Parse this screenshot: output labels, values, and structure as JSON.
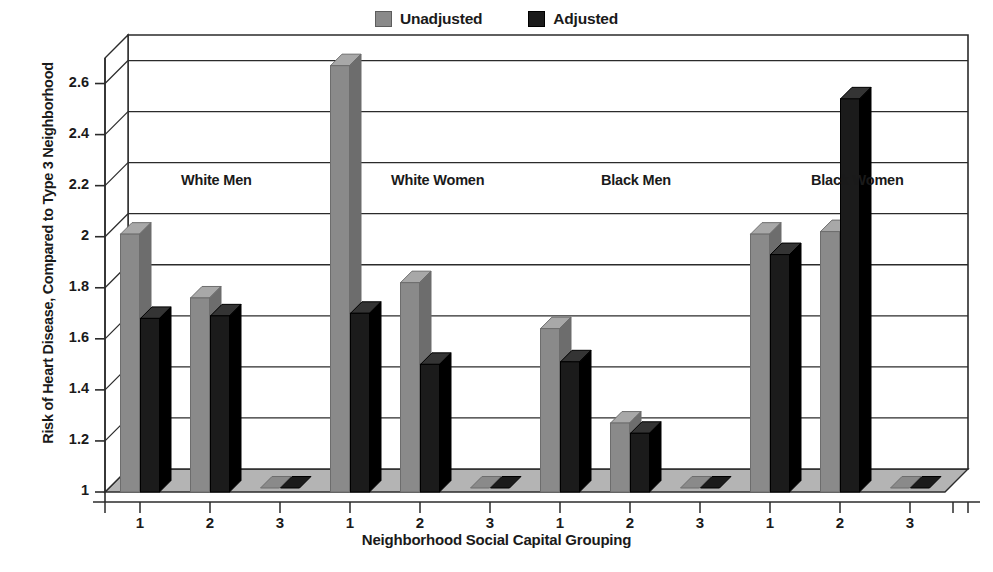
{
  "legend": {
    "items": [
      {
        "label": "Unadjusted",
        "color": "#8a8a8a",
        "swatch": "unadjusted-swatch"
      },
      {
        "label": "Adjusted",
        "color": "#1b1b1b",
        "swatch": "adjusted-swatch"
      }
    ]
  },
  "axes": {
    "ylabel": "Risk of Heart Disease, Compared to Type 3 Neighborhood",
    "xlabel": "Neighborhood Social Capital Grouping",
    "yticks": [
      "1",
      "1.2",
      "1.4",
      "1.6",
      "1.8",
      "2",
      "2.2",
      "2.4",
      "2.6"
    ],
    "ymin": 1,
    "ymax": 2.7
  },
  "chart_data": {
    "type": "bar",
    "title": "",
    "subtitle": "",
    "xlabel": "Neighborhood Social Capital Grouping",
    "ylabel": "Risk of Heart Disease, Compared to Type 3 Neighborhood",
    "ylim": [
      1,
      2.7
    ],
    "ytick_values": [
      1,
      1.2,
      1.4,
      1.6,
      1.8,
      2,
      2.2,
      2.4,
      2.6
    ],
    "grid": true,
    "legend_position": "top-center",
    "style": "3d-column",
    "categories": [
      "1",
      "2",
      "3"
    ],
    "groups": [
      {
        "name": "White Men",
        "categories": [
          "1",
          "2",
          "3"
        ],
        "series": [
          {
            "name": "Unadjusted",
            "values": [
              2.01,
              1.76,
              1.0
            ]
          },
          {
            "name": "Adjusted",
            "values": [
              1.68,
              1.69,
              1.0
            ]
          }
        ]
      },
      {
        "name": "White Women",
        "categories": [
          "1",
          "2",
          "3"
        ],
        "series": [
          {
            "name": "Unadjusted",
            "values": [
              2.67,
              1.82,
              1.0
            ]
          },
          {
            "name": "Adjusted",
            "values": [
              1.7,
              1.5,
              1.0
            ]
          }
        ]
      },
      {
        "name": "Black Men",
        "categories": [
          "1",
          "2",
          "3"
        ],
        "series": [
          {
            "name": "Unadjusted",
            "values": [
              1.64,
              1.27,
              1.0
            ]
          },
          {
            "name": "Adjusted",
            "values": [
              1.51,
              1.23,
              1.0
            ]
          }
        ]
      },
      {
        "name": "Black Women",
        "categories": [
          "1",
          "2",
          "3"
        ],
        "series": [
          {
            "name": "Unadjusted",
            "values": [
              2.01,
              2.02,
              1.0
            ]
          },
          {
            "name": "Adjusted",
            "values": [
              1.93,
              2.54,
              1.0
            ]
          }
        ]
      }
    ],
    "series_colors": {
      "Unadjusted": "#8a8a8a",
      "Adjusted": "#1b1b1b"
    }
  }
}
